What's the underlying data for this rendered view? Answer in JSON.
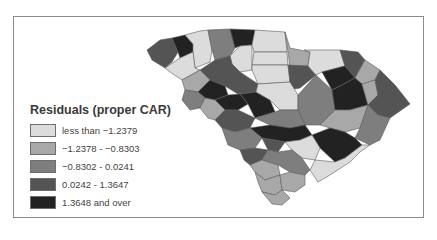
{
  "legend": {
    "title": "Residuals (proper CAR)",
    "classes": [
      {
        "label": "less than −1.2379",
        "color": "#dcdcdc"
      },
      {
        "label": "−1.2378 - −0.8303",
        "color": "#a8a8a8"
      },
      {
        "label": "−0.8302 - 0.0241",
        "color": "#7e7e7e"
      },
      {
        "label": "0.0242 - 1.3647",
        "color": "#545454"
      },
      {
        "label": "1.3648 and over",
        "color": "#222222"
      }
    ]
  }
}
